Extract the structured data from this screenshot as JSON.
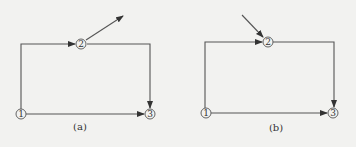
{
  "figure": {
    "background": "#f2f2f0",
    "line_color": "#555555",
    "panels": [
      {
        "caption": "(a)",
        "nodes": [
          {
            "id": "1",
            "label": "1"
          },
          {
            "id": "2",
            "label": "2"
          },
          {
            "id": "3",
            "label": "3"
          }
        ],
        "edges": [
          {
            "from": "1",
            "to": "2",
            "route": "up then right"
          },
          {
            "from": "2",
            "to": "3",
            "route": "right then down"
          },
          {
            "from": "1",
            "to": "3",
            "route": "straight right"
          },
          {
            "from": "2",
            "to": "external",
            "direction": "outgoing up-right"
          }
        ]
      },
      {
        "caption": "(b)",
        "nodes": [
          {
            "id": "1",
            "label": "1"
          },
          {
            "id": "2",
            "label": "2"
          },
          {
            "id": "3",
            "label": "3"
          }
        ],
        "edges": [
          {
            "from": "1",
            "to": "2",
            "route": "up then right"
          },
          {
            "from": "2",
            "to": "3",
            "route": "right then down"
          },
          {
            "from": "1",
            "to": "3",
            "route": "straight right"
          },
          {
            "from": "external",
            "to": "2",
            "direction": "incoming from up-left"
          }
        ]
      }
    ]
  }
}
